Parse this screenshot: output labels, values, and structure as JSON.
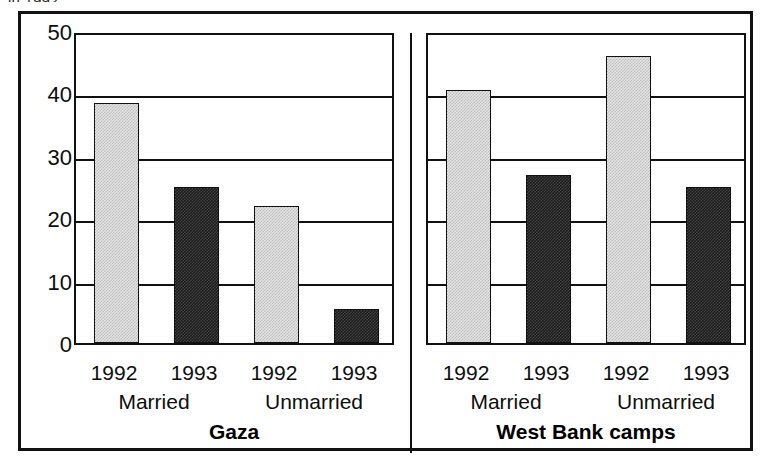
{
  "top_caption_fragment": "in 1992",
  "chart_data": {
    "type": "bar",
    "title": "",
    "subtitle": "",
    "xlabel": "",
    "ylabel": "",
    "ylim": [
      0,
      50
    ],
    "yticks": [
      0,
      10,
      20,
      30,
      40,
      50
    ],
    "ytick_labels": [
      "0",
      "10",
      "20",
      "30",
      "40",
      "50"
    ],
    "grid": true,
    "grid_axis": "y",
    "legend": null,
    "legend_position": "none",
    "panels": [
      {
        "name": "Gaza",
        "label": "Gaza",
        "groups": [
          {
            "label": "Married",
            "bars": [
              {
                "category": "1992",
                "value": 38.5,
                "style": "light"
              },
              {
                "category": "1993",
                "value": 25.0,
                "style": "dark"
              }
            ]
          },
          {
            "label": "Unmarried",
            "bars": [
              {
                "category": "1992",
                "value": 22.0,
                "style": "light"
              },
              {
                "category": "1993",
                "value": 5.5,
                "style": "dark"
              }
            ]
          }
        ]
      },
      {
        "name": "West Bank camps",
        "label": "West Bank camps",
        "groups": [
          {
            "label": "Married",
            "bars": [
              {
                "category": "1992",
                "value": 40.5,
                "style": "light"
              },
              {
                "category": "1993",
                "value": 27.0,
                "style": "dark"
              }
            ]
          },
          {
            "label": "Unmarried",
            "bars": [
              {
                "category": "1992",
                "value": 46.0,
                "style": "light"
              },
              {
                "category": "1993",
                "value": 25.0,
                "style": "dark"
              }
            ]
          }
        ]
      }
    ],
    "colors": {
      "bar_light": "#e3e3e3",
      "bar_dark": "#1b1b1b",
      "axis": "#111111",
      "frame": "#121212",
      "text": "#0d0d0d",
      "background": "#ffffff"
    }
  }
}
